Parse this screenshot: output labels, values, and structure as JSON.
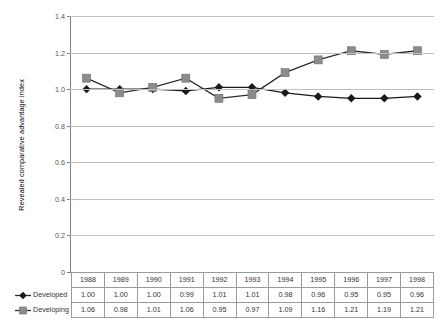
{
  "chart_data": {
    "type": "line",
    "title": "",
    "xlabel": "",
    "ylabel": "Revealed comparative advantage index",
    "ylim": [
      0,
      1.4
    ],
    "yticks": [
      "0",
      "0.2",
      "0.4",
      "0.6",
      "0.8",
      "1.0",
      "1.2",
      "1.4"
    ],
    "ytick_values": [
      0,
      0.2,
      0.4,
      0.6,
      0.8,
      1.0,
      1.2,
      1.4
    ],
    "grid": true,
    "legend_position": "table-row-headers",
    "categories": [
      "1988",
      "1989",
      "1990",
      "1991",
      "1992",
      "1993",
      "1994",
      "1995",
      "1996",
      "1997",
      "1998"
    ],
    "series": [
      {
        "name": "Developed",
        "marker": "diamond",
        "color": "#1a1a1a",
        "values": [
          1.0,
          1.0,
          1.0,
          0.99,
          1.01,
          1.01,
          0.98,
          0.96,
          0.95,
          0.95,
          0.96
        ],
        "labels": [
          "1.00",
          "1.00",
          "1.00",
          "0.99",
          "1.01",
          "1.01",
          "0.98",
          "0.96",
          "0.95",
          "0.95",
          "0.96"
        ]
      },
      {
        "name": "Developing",
        "marker": "square",
        "color": "#8c8c8c",
        "values": [
          1.06,
          0.98,
          1.01,
          1.06,
          0.95,
          0.97,
          1.09,
          1.16,
          1.21,
          1.19,
          1.21
        ],
        "labels": [
          "1.06",
          "0.98",
          "1.01",
          "1.06",
          "0.95",
          "0.97",
          "1.09",
          "1.16",
          "1.21",
          "1.19",
          "1.21"
        ]
      }
    ]
  },
  "table": {
    "row_headers": [
      "",
      "Developed",
      "Developing"
    ]
  },
  "colors": {
    "developed": "#1a1a1a",
    "developing": "#8c8c8c",
    "gridline": "#bfbfbf",
    "axis": "#808080",
    "table_border": "#9a9a9a"
  }
}
